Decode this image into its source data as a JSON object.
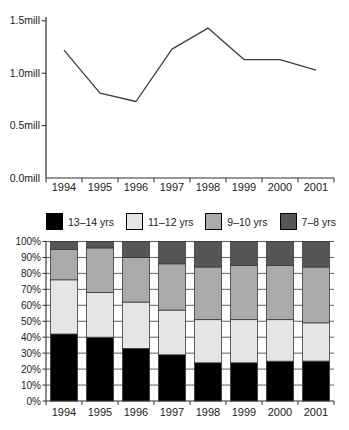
{
  "figure": {
    "background": "#ffffff",
    "text_color": "#1b1b1b",
    "axis_color": "#2e2e2e"
  },
  "chart_data": [
    {
      "type": "line",
      "title": "",
      "xlabel": "",
      "ylabel": "",
      "categories": [
        "1994",
        "1995",
        "1996",
        "1997",
        "1998",
        "1999",
        "2000",
        "2001"
      ],
      "values": [
        1.22,
        0.81,
        0.73,
        1.23,
        1.43,
        1.13,
        1.13,
        1.03
      ],
      "unit": "mill",
      "ylim": [
        0.0,
        1.5
      ],
      "yticks": [
        {
          "value": 0.0,
          "label": "0.0mill"
        },
        {
          "value": 0.5,
          "label": "0.5mill"
        },
        {
          "value": 1.0,
          "label": "1.0mill"
        },
        {
          "value": 1.5,
          "label": "1.5mill"
        }
      ],
      "line_color": "#3d3d3d",
      "grid": false,
      "legend": null
    },
    {
      "type": "stacked-bar-100",
      "title": "",
      "xlabel": "",
      "ylabel": "",
      "categories": [
        "1994",
        "1995",
        "1996",
        "1997",
        "1998",
        "1999",
        "2000",
        "2001"
      ],
      "series": [
        {
          "name": "13–14 yrs",
          "color": "#000000",
          "values": [
            42,
            40,
            33,
            29,
            24,
            24,
            25,
            25
          ]
        },
        {
          "name": "11–12 yrs",
          "color": "#e6e6e6",
          "values": [
            34,
            28,
            29,
            28,
            27,
            27,
            26,
            24
          ]
        },
        {
          "name": "9–10 yrs",
          "color": "#aaaaaa",
          "values": [
            19,
            28,
            28,
            29,
            33,
            34,
            34,
            35
          ]
        },
        {
          "name": "7–8 yrs",
          "color": "#565656",
          "values": [
            5,
            4,
            10,
            14,
            16,
            15,
            15,
            16
          ]
        }
      ],
      "ylim": [
        0,
        100
      ],
      "yticks": [
        "0%",
        "10%",
        "20%",
        "30%",
        "40%",
        "50%",
        "60%",
        "70%",
        "80%",
        "90%",
        "100%"
      ],
      "grid": true,
      "legend_position": "top",
      "gridline_color": "#4f4f4f",
      "bar_outline_color": "#383838"
    }
  ]
}
